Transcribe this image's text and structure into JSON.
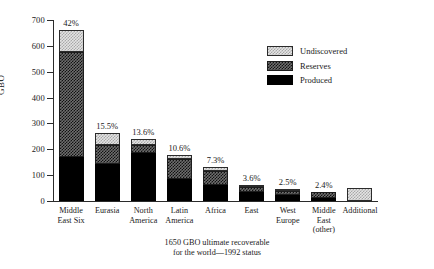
{
  "chart_data": {
    "type": "bar",
    "stacked": true,
    "title": "",
    "subtitle": "",
    "xlabel": "",
    "ylabel": "GBO",
    "ylim": [
      0,
      700
    ],
    "ytick_step": 100,
    "yticks": [
      "0",
      "100",
      "200",
      "300",
      "400",
      "500",
      "600",
      "700"
    ],
    "grid": false,
    "legend_position": "upper-right",
    "categories": [
      "Middle\nEast Six",
      "Eurasia",
      "North\nAmerica",
      "Latin\nAmerica",
      "Africa",
      "East",
      "West\nEurope",
      "Middle\nEast\n(other)",
      "Additional"
    ],
    "series": [
      {
        "name": "Produced",
        "values": [
          170,
          143,
          184,
          86,
          62,
          35,
          22,
          12,
          0
        ]
      },
      {
        "name": "Reserves",
        "values": [
          405,
          72,
          32,
          77,
          56,
          20,
          18,
          23,
          0
        ]
      },
      {
        "name": "Undiscovered",
        "values": [
          85,
          48,
          25,
          16,
          13,
          5,
          5,
          0,
          52
        ]
      }
    ],
    "totals": [
      660,
      263,
      241,
      179,
      131,
      60,
      45,
      35,
      52
    ],
    "data_labels": [
      "42%",
      "15.5%",
      "13.6%",
      "10.6%",
      "7.3%",
      "3.6%",
      "2.5%",
      "2.4%",
      ""
    ],
    "legend": [
      {
        "label": "Undiscovered",
        "pattern": "light-checker"
      },
      {
        "label": "Reserves",
        "pattern": "dark-checker"
      },
      {
        "label": "Produced",
        "pattern": "solid-black"
      }
    ],
    "annotations": [
      "1650 GBO ultimate recoverable\nfor the world—1992 status"
    ]
  },
  "caption": {
    "text": "1650 GBO ultimate recoverable\nfor the world—1992 status"
  },
  "colors": {
    "produced": "#000000",
    "reserves": "#6e6e6e",
    "undiscovered": "#e4e4e4",
    "axis": "#2b2b2b",
    "background": "#ffffff"
  }
}
